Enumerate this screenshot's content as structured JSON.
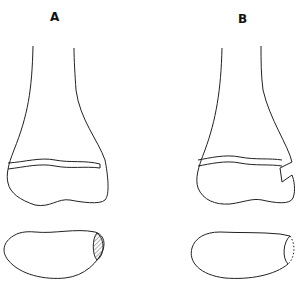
{
  "figure": {
    "panels": [
      {
        "label": "A",
        "description": "distal bone with intact growth plate; condyle cross-section with hatched area"
      },
      {
        "label": "B",
        "description": "distal bone with step fracture through growth plate; condyle cross-section with dotted defect"
      }
    ],
    "colors": {
      "line": "#222222",
      "background": "#ffffff"
    }
  }
}
